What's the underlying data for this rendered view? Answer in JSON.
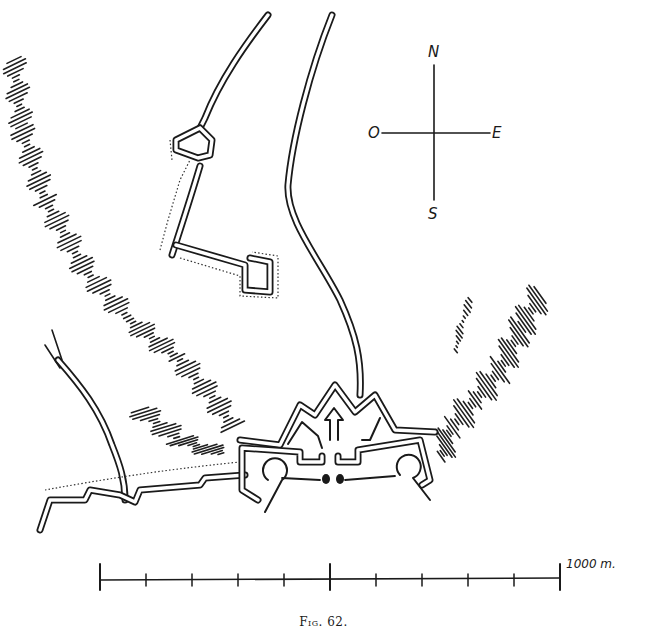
{
  "figure": {
    "caption": "Fig. 62.",
    "type": "fortification plan",
    "ink_color": "#1a1a1a",
    "background": "#ffffff"
  },
  "compass": {
    "north": "N",
    "south": "S",
    "east": "E",
    "west": "O"
  },
  "scale_bar": {
    "label": "1000 m.",
    "ticks": 11,
    "start_x": 100,
    "end_x": 560,
    "major_tick_positions": [
      100,
      328,
      560
    ]
  },
  "features": [
    {
      "name": "fortress",
      "description": "bastioned fortress with central gate and two round towers"
    },
    {
      "name": "north-road",
      "description": "double-line road running north from the fortress gate"
    },
    {
      "name": "outwork-line",
      "description": "double-walled line with dotted glacis to the north-west"
    },
    {
      "name": "west-ridge",
      "description": "hachured hill ridge to the west"
    },
    {
      "name": "east-ridge",
      "description": "hachured hill ridge to the east"
    },
    {
      "name": "south-west-wall",
      "description": "stepped wall running west from the fortress"
    },
    {
      "name": "west-road",
      "description": "forked road coming from the north-west"
    }
  ]
}
